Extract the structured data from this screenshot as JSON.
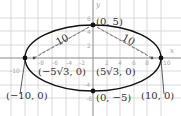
{
  "diagram": {
    "type": "ellipse-graph",
    "equation_implied": "x^2/100 + y^2/25 = 1",
    "axes": {
      "x_label": "x",
      "y_label": "y"
    },
    "x_ticks": [
      "-8",
      "-6",
      "-4",
      "-2",
      "2",
      "4",
      "6",
      "8",
      "10",
      "-10"
    ],
    "y_ticks": [
      "6",
      "4",
      "2",
      "-4",
      "-6"
    ],
    "vertices": [
      {
        "label": "(0, 5)",
        "x": 0,
        "y": 5
      },
      {
        "label": "(0, −5)",
        "x": 0,
        "y": -5
      },
      {
        "label": "(−10, 0)",
        "x": -10,
        "y": 0
      },
      {
        "label": "(10, 0)",
        "x": 10,
        "y": 0
      }
    ],
    "foci": [
      {
        "label": "(−5√3, 0)",
        "x": -8.66,
        "y": 0
      },
      {
        "label": "(5√3, 0)",
        "x": 8.66,
        "y": 0
      }
    ],
    "segment_labels": [
      "10",
      "10"
    ],
    "colors": {
      "curve": "#111111",
      "grid": "#cccccc",
      "axis": "#888888",
      "dash": "#555555"
    }
  }
}
